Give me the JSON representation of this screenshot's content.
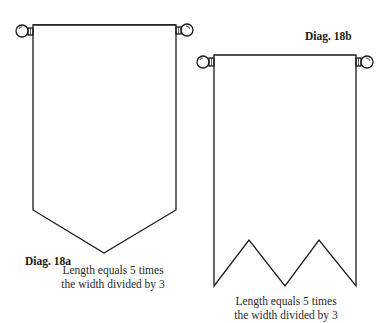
{
  "diagrams": [
    {
      "id": "18a",
      "label": "Diag. 18a",
      "shape": "pointed-banner",
      "caption_line1": "Length equals 5 times",
      "caption_line2": "the width divided by 3"
    },
    {
      "id": "18b",
      "label": "Diag. 18b",
      "shape": "swallowtail-double-point-banner",
      "caption_line1": "Length equals 5 times",
      "caption_line2": "the width divided by 3"
    }
  ],
  "colors": {
    "line": "#1a1a1a",
    "background": "#ffffff"
  }
}
